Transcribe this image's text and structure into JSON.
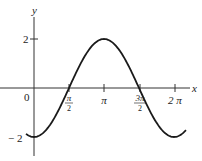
{
  "chart_data": {
    "type": "line",
    "title": "",
    "function": "y = -2cos(x)",
    "xlabel": "x",
    "ylabel": "y",
    "origin_label": "0",
    "x_ticks": [
      {
        "value": 1.5708,
        "label_num": "π",
        "label_den": "2",
        "fraction": true
      },
      {
        "value": 3.1416,
        "label": "π",
        "fraction": false
      },
      {
        "value": 4.7124,
        "label_num": "3π",
        "label_den": "2",
        "fraction": true
      },
      {
        "value": 6.2832,
        "label": "2 π",
        "fraction": false
      }
    ],
    "y_ticks": [
      {
        "value": 2,
        "label": "2"
      },
      {
        "value": -2,
        "label": "− 2"
      }
    ],
    "xlim": [
      -0.36,
      6.82
    ],
    "ylim": [
      -2.6,
      3.1
    ],
    "grid": false,
    "legend": null,
    "series": [
      {
        "name": "-2cos(x)",
        "x": [
          -0.36,
          0,
          0.7854,
          1.5708,
          2.3562,
          3.1416,
          3.927,
          4.7124,
          5.4978,
          6.2832,
          6.82
        ],
        "values": [
          -1.87,
          -2,
          -1.41,
          0,
          1.41,
          2,
          1.41,
          0,
          -1.41,
          -2,
          -1.72
        ]
      }
    ],
    "colors": {
      "curve": "#1a1a1a",
      "axes": "#333333"
    }
  }
}
